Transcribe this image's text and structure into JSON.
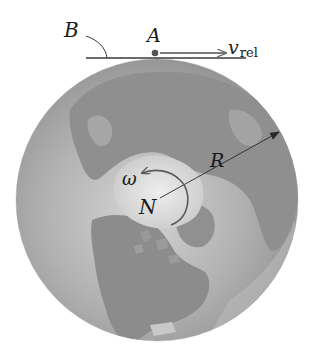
{
  "figure": {
    "type": "physics-diagram",
    "colors": {
      "background": "#ffffff",
      "ocean": "#a8a8a8",
      "land": "#8c8c8c",
      "polar_ice": "#e6e6e6",
      "highlight": "#d8d8d8",
      "line": "#3a3a3a",
      "arrow": "#7a7a7a"
    }
  },
  "labels": {
    "B": "B",
    "A": "A",
    "v_rel_main": "v",
    "v_rel_sub": "rel",
    "omega": "ω",
    "N": "N",
    "R": "R"
  }
}
